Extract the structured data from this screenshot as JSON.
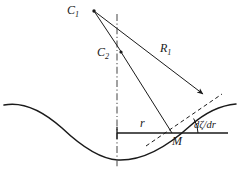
{
  "figure": {
    "type": "geometry-diagram",
    "width": 237,
    "height": 169,
    "background_color": "#ffffff",
    "stroke_color": "#1a1a1a"
  },
  "labels": {
    "c1": {
      "text": "C",
      "sub": "1",
      "name": "center-of-curvature-1"
    },
    "c2": {
      "text": "C",
      "sub": "2",
      "name": "center-of-curvature-2"
    },
    "r1": {
      "text": "R",
      "sub": "1",
      "name": "radius-of-curvature-1"
    },
    "r": {
      "text": "r",
      "sub": "",
      "name": "radial-distance"
    },
    "m": {
      "text": "M",
      "sub": "",
      "name": "point-m"
    },
    "slope": {
      "text": "dζ/dr",
      "sub": "",
      "name": "surface-slope"
    }
  },
  "elements": {
    "wave_curve": {
      "name": "wave-surface-curve",
      "path": "M 4,105 C 24,101 44,112 62,128 C 82,147 100,159 118,160 C 142,161 168,146 190,126 C 208,110 224,105 236,104",
      "stroke_width": 1.4,
      "style": "solid"
    },
    "axis_vertical": {
      "name": "vertical-axis-dash-dot",
      "x": 117,
      "y_top": 14,
      "y_bottom": 167,
      "style": "dash-dot",
      "stroke_width": 1.1
    },
    "horizontal_line": {
      "name": "horizontal-reference-line",
      "x_start": 117,
      "x_end": 228,
      "y": 133,
      "style": "solid",
      "stroke_width": 1.4
    },
    "axis_tick": {
      "name": "axis-origin-tick",
      "x": 117,
      "y_top": 127,
      "y_bottom": 139
    },
    "line_c1_c2": {
      "name": "line-c1-to-c2",
      "x1": 94,
      "y1": 11,
      "x2": 122,
      "y2": 53,
      "style": "solid"
    },
    "line_c1_r1": {
      "name": "radius-line-r1",
      "x1": 94,
      "y1": 11,
      "x2": 204,
      "y2": 95,
      "style": "solid",
      "has_arrow": true
    },
    "line_c2_m": {
      "name": "radius-line-c2-to-m",
      "x1": 121,
      "y1": 52,
      "x2": 172,
      "y2": 133,
      "style": "solid"
    },
    "tangent_dashed": {
      "name": "tangent-line-dashed",
      "x1": 145,
      "y1": 146,
      "x2": 222,
      "y2": 95,
      "style": "dashed"
    },
    "angle_arc": {
      "name": "slope-angle-arc",
      "center_x": 172,
      "center_y": 133,
      "radius": 26,
      "start_angle_deg": 0,
      "end_angle_deg": 34
    }
  }
}
